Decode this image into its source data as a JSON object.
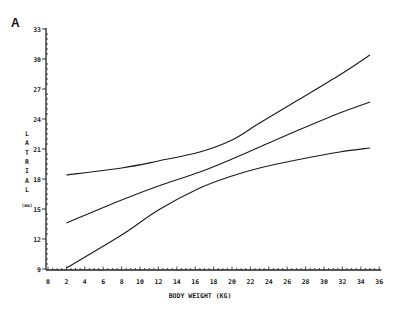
{
  "panel_label": "A",
  "chart_data": {
    "type": "line",
    "title": "",
    "xlabel": "BODY WEIGHT (KG)",
    "ylabel": "LATRIAL",
    "ylabel_unit": "(mm)",
    "xlim": [
      0,
      36
    ],
    "ylim": [
      9,
      33
    ],
    "xticks": [
      0,
      2,
      4,
      6,
      8,
      10,
      12,
      14,
      16,
      18,
      20,
      22,
      24,
      26,
      28,
      30,
      32,
      34,
      36
    ],
    "yticks": [
      9,
      12,
      15,
      18,
      21,
      24,
      27,
      30,
      33
    ],
    "grid": false,
    "legend": null,
    "series": [
      {
        "name": "upper limit",
        "x": [
          2,
          8,
          12,
          16.5,
          20,
          23,
          27,
          31.7,
          35
        ],
        "values": [
          18.4,
          19.1,
          19.8,
          20.7,
          21.9,
          23.6,
          25.8,
          28.4,
          30.4
        ]
      },
      {
        "name": "mean",
        "x": [
          2,
          8,
          12,
          16.5,
          20,
          23,
          27,
          31.7,
          35
        ],
        "values": [
          13.6,
          15.9,
          17.3,
          18.7,
          20.0,
          21.2,
          22.8,
          24.6,
          25.7
        ]
      },
      {
        "name": "lower limit",
        "x": [
          2,
          8,
          12,
          16.5,
          20,
          23,
          27,
          31.7,
          35
        ],
        "values": [
          9.1,
          12.4,
          14.9,
          17.1,
          18.3,
          19.1,
          19.9,
          20.7,
          21.1
        ]
      }
    ]
  }
}
